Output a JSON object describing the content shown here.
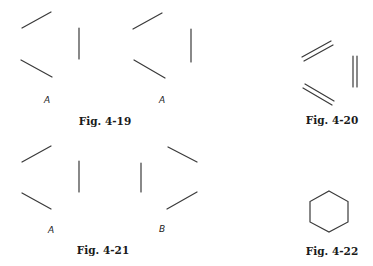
{
  "figures": [
    {
      "id": "fig-4-19",
      "caption": "Fig. 4-19",
      "labels": [
        "A",
        "A"
      ]
    },
    {
      "id": "fig-4-20",
      "caption": "Fig. 4-20",
      "labels": []
    },
    {
      "id": "fig-4-21",
      "caption": "Fig. 4-21",
      "labels": [
        "A",
        "B"
      ]
    },
    {
      "id": "fig-4-22",
      "caption": "Fig. 4-22",
      "labels": []
    }
  ],
  "colors": {
    "line": "#3a3a3a",
    "text": "#1a1a1a",
    "background": "#ffffff"
  }
}
